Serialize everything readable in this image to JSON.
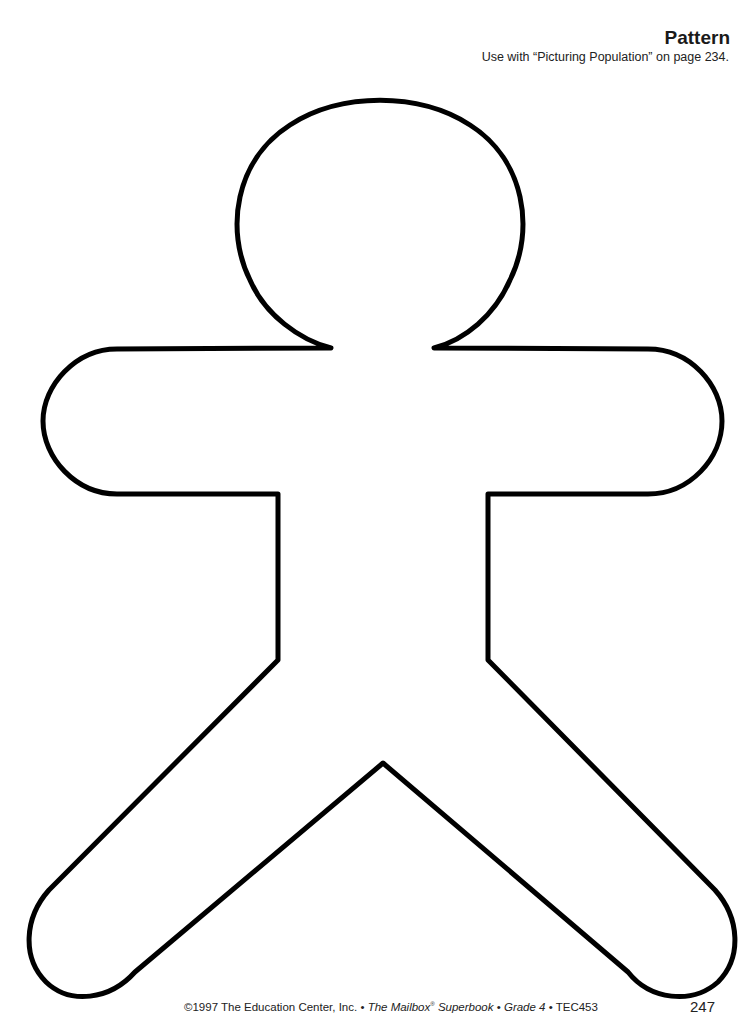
{
  "header": {
    "title": "Pattern",
    "subtitle": "Use with “Picturing Population” on page 234."
  },
  "figure": {
    "name": "gingerbread-person-outline",
    "stroke_color": "#000000",
    "stroke_width": 5
  },
  "footer": {
    "copyright": "©1997 The Education Center, Inc. • ",
    "book_title": "The Mailbox",
    "registered": "®",
    "book_title_2": " Superbook",
    "separator_1": " • ",
    "grade": "Grade 4",
    "separator_2": " • ",
    "code": "TEC453",
    "page_number": "247"
  }
}
